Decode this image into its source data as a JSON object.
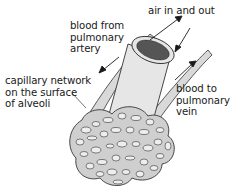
{
  "diagram": {
    "type": "anatomical illustration",
    "labels": {
      "air": "air in and out",
      "artery": "blood from\npulmonary\nartery",
      "capillary": "capillary network\non the surface\nof alveoli",
      "vein": "blood to\npulmonary\nvein"
    },
    "colors": {
      "outline": "#333333",
      "vessel_fill": "#d9d9d9",
      "airway_fill": "#e6e6e6",
      "airway_lumen": "#555555",
      "alveoli_fill": "#cfcfcf",
      "background": "#ffffff"
    }
  }
}
